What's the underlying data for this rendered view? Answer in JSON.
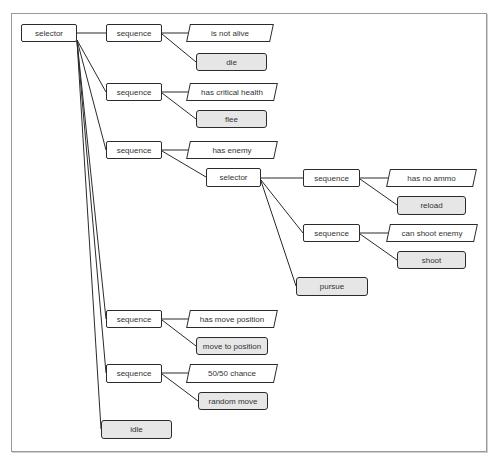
{
  "diagram": {
    "title": "",
    "type": "behavior-tree",
    "colors": {
      "stroke": "#2b2b2b",
      "composite_fill": "#ffffff",
      "action_fill": "#e6e6e6",
      "condition_fill": "#ffffff",
      "frame": "#9a9a9a"
    },
    "nodes": [
      {
        "id": "root",
        "label": "selector",
        "kind": "composite",
        "x": 21,
        "y": 24,
        "w": 56,
        "h": 18
      },
      {
        "id": "seq1",
        "label": "sequence",
        "kind": "composite",
        "x": 106,
        "y": 24,
        "w": 56,
        "h": 18
      },
      {
        "id": "c1",
        "label": "is not alive",
        "kind": "condition",
        "x": 188,
        "y": 24,
        "w": 84,
        "h": 18
      },
      {
        "id": "a1",
        "label": "die",
        "kind": "action",
        "x": 196,
        "y": 53,
        "w": 71,
        "h": 18
      },
      {
        "id": "seq2",
        "label": "sequence",
        "kind": "composite",
        "x": 106,
        "y": 83,
        "w": 56,
        "h": 18
      },
      {
        "id": "c2",
        "label": "has critical health",
        "kind": "condition",
        "x": 188,
        "y": 83,
        "w": 88,
        "h": 18
      },
      {
        "id": "a2",
        "label": "flee",
        "kind": "action",
        "x": 196,
        "y": 110,
        "w": 71,
        "h": 18
      },
      {
        "id": "seq3",
        "label": "sequence",
        "kind": "composite",
        "x": 106,
        "y": 141,
        "w": 56,
        "h": 18
      },
      {
        "id": "c3",
        "label": "has enemy",
        "kind": "condition",
        "x": 188,
        "y": 141,
        "w": 88,
        "h": 18
      },
      {
        "id": "sel2",
        "label": "selector",
        "kind": "composite",
        "x": 206,
        "y": 168,
        "w": 55,
        "h": 19
      },
      {
        "id": "seq31",
        "label": "sequence",
        "kind": "composite",
        "x": 303,
        "y": 169,
        "w": 57,
        "h": 18
      },
      {
        "id": "c31",
        "label": "has no ammo",
        "kind": "condition",
        "x": 388,
        "y": 169,
        "w": 87,
        "h": 18
      },
      {
        "id": "a31",
        "label": "reload",
        "kind": "action",
        "x": 397,
        "y": 196,
        "w": 69,
        "h": 19
      },
      {
        "id": "seq32",
        "label": "sequence",
        "kind": "composite",
        "x": 303,
        "y": 224,
        "w": 57,
        "h": 18
      },
      {
        "id": "c32",
        "label": "can shoot enemy",
        "kind": "condition",
        "x": 388,
        "y": 224,
        "w": 88,
        "h": 18
      },
      {
        "id": "a32",
        "label": "shoot",
        "kind": "action",
        "x": 397,
        "y": 251,
        "w": 69,
        "h": 18
      },
      {
        "id": "a33",
        "label": "pursue",
        "kind": "action",
        "x": 296,
        "y": 277,
        "w": 72,
        "h": 19
      },
      {
        "id": "seq4",
        "label": "sequence",
        "kind": "composite",
        "x": 106,
        "y": 310,
        "w": 56,
        "h": 18
      },
      {
        "id": "c4",
        "label": "has move position",
        "kind": "condition",
        "x": 188,
        "y": 310,
        "w": 88,
        "h": 18
      },
      {
        "id": "a4",
        "label": "move to position",
        "kind": "action",
        "x": 196,
        "y": 337,
        "w": 72,
        "h": 18
      },
      {
        "id": "seq5",
        "label": "sequence",
        "kind": "composite",
        "x": 106,
        "y": 364,
        "w": 56,
        "h": 19
      },
      {
        "id": "c5",
        "label": "50/50 chance",
        "kind": "condition",
        "x": 188,
        "y": 364,
        "w": 88,
        "h": 19
      },
      {
        "id": "a5",
        "label": "random move",
        "kind": "action",
        "x": 198,
        "y": 392,
        "w": 70,
        "h": 18
      },
      {
        "id": "a6",
        "label": "idle",
        "kind": "action",
        "x": 101,
        "y": 420,
        "w": 71,
        "h": 19
      }
    ],
    "edges": [
      {
        "from": "root",
        "to": "seq1",
        "x1": 77,
        "y1": 33,
        "x2": 106,
        "y2": 33
      },
      {
        "from": "root",
        "to": "seq2",
        "x1": 77,
        "y1": 40,
        "x2": 106,
        "y2": 92
      },
      {
        "from": "root",
        "to": "seq3",
        "x1": 77,
        "y1": 40,
        "x2": 106,
        "y2": 150
      },
      {
        "from": "root",
        "to": "seq4",
        "x1": 77,
        "y1": 41,
        "x2": 106,
        "y2": 319
      },
      {
        "from": "root",
        "to": "seq5",
        "x1": 77,
        "y1": 41,
        "x2": 106,
        "y2": 373
      },
      {
        "from": "root",
        "to": "a6",
        "x1": 77,
        "y1": 41,
        "x2": 101,
        "y2": 429
      },
      {
        "from": "seq1",
        "to": "c1",
        "x1": 162,
        "y1": 33,
        "x2": 190,
        "y2": 33
      },
      {
        "from": "seq1",
        "to": "a1",
        "x1": 162,
        "y1": 34,
        "x2": 196,
        "y2": 62
      },
      {
        "from": "seq2",
        "to": "c2",
        "x1": 162,
        "y1": 92,
        "x2": 190,
        "y2": 92
      },
      {
        "from": "seq2",
        "to": "a2",
        "x1": 162,
        "y1": 93,
        "x2": 196,
        "y2": 119
      },
      {
        "from": "seq3",
        "to": "c3",
        "x1": 162,
        "y1": 150,
        "x2": 190,
        "y2": 150
      },
      {
        "from": "seq3",
        "to": "sel2",
        "x1": 162,
        "y1": 151,
        "x2": 206,
        "y2": 177
      },
      {
        "from": "sel2",
        "to": "seq31",
        "x1": 261,
        "y1": 178,
        "x2": 303,
        "y2": 178
      },
      {
        "from": "sel2",
        "to": "seq32",
        "x1": 261,
        "y1": 180,
        "x2": 303,
        "y2": 233
      },
      {
        "from": "sel2",
        "to": "a33",
        "x1": 261,
        "y1": 181,
        "x2": 296,
        "y2": 286
      },
      {
        "from": "seq31",
        "to": "c31",
        "x1": 360,
        "y1": 178,
        "x2": 390,
        "y2": 178
      },
      {
        "from": "seq31",
        "to": "a31",
        "x1": 360,
        "y1": 179,
        "x2": 397,
        "y2": 205
      },
      {
        "from": "seq32",
        "to": "c32",
        "x1": 360,
        "y1": 233,
        "x2": 390,
        "y2": 233
      },
      {
        "from": "seq32",
        "to": "a32",
        "x1": 360,
        "y1": 234,
        "x2": 397,
        "y2": 260
      },
      {
        "from": "seq4",
        "to": "c4",
        "x1": 162,
        "y1": 319,
        "x2": 190,
        "y2": 319
      },
      {
        "from": "seq4",
        "to": "a4",
        "x1": 162,
        "y1": 320,
        "x2": 196,
        "y2": 346
      },
      {
        "from": "seq5",
        "to": "c5",
        "x1": 162,
        "y1": 373,
        "x2": 190,
        "y2": 373
      },
      {
        "from": "seq5",
        "to": "a5",
        "x1": 162,
        "y1": 374,
        "x2": 198,
        "y2": 401
      }
    ]
  }
}
